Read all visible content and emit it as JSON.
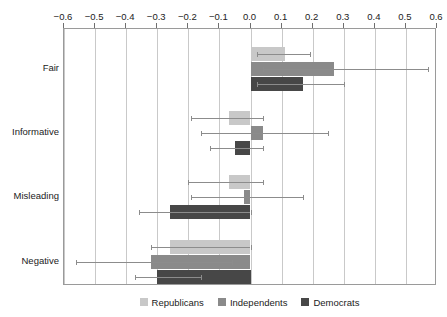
{
  "chart_data": {
    "type": "bar",
    "orientation": "horizontal",
    "title": "",
    "xlabel": "",
    "ylabel": "",
    "categories": [
      "Fair",
      "Informative",
      "Misleading",
      "Negative"
    ],
    "xlim": [
      -0.6,
      0.6
    ],
    "xticks": [
      -0.6,
      -0.5,
      -0.4,
      -0.3,
      -0.2,
      -0.1,
      0.0,
      0.1,
      0.2,
      0.3,
      0.4,
      0.5,
      0.6
    ],
    "xticklabels": [
      "−0.6",
      "−0.5",
      "−0.4",
      "−0.3",
      "−0.2",
      "−0.1",
      "0.0",
      "0.1",
      "0.2",
      "0.3",
      "0.4",
      "0.5",
      "0.6"
    ],
    "grid": true,
    "grid_axis": "x",
    "legend_position": "bottom",
    "series": [
      {
        "name": "Republicans",
        "color": "#c8c8c8",
        "values": [
          0.11,
          -0.07,
          -0.07,
          -0.26
        ],
        "ci_low": [
          0.02,
          -0.19,
          -0.2,
          -0.32
        ],
        "ci_high": [
          0.19,
          0.04,
          0.04,
          0.0
        ]
      },
      {
        "name": "Independents",
        "color": "#8a8a8a",
        "values": [
          0.27,
          0.04,
          -0.02,
          -0.32
        ],
        "ci_low": [
          0.04,
          -0.16,
          -0.19,
          -0.56
        ],
        "ci_high": [
          0.57,
          0.25,
          0.17,
          -0.06
        ]
      },
      {
        "name": "Democrats",
        "color": "#474747",
        "values": [
          0.17,
          -0.05,
          -0.26,
          -0.3
        ],
        "ci_low": [
          0.02,
          -0.13,
          -0.36,
          -0.37
        ],
        "ci_high": [
          0.3,
          0.04,
          0.0,
          -0.16
        ]
      }
    ]
  },
  "legend": {
    "items": [
      {
        "label": "Republicans"
      },
      {
        "label": "Independents"
      },
      {
        "label": "Democrats"
      }
    ]
  }
}
